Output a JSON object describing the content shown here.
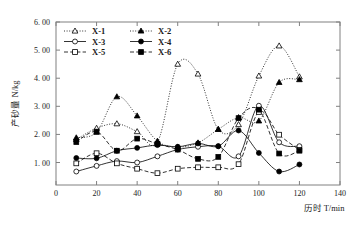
{
  "chart_data": {
    "type": "line",
    "title": "",
    "xlabel": "历时 T/min",
    "ylabel": "产砂量 N/kg",
    "xlim": [
      0,
      140
    ],
    "ylim": [
      0.2,
      6.0
    ],
    "xticks": [
      0,
      20,
      40,
      60,
      80,
      100,
      120,
      140
    ],
    "xtick_labels": [
      "0",
      "20",
      "40",
      "60",
      "80",
      "100",
      "120",
      "140"
    ],
    "yticks": [
      1.0,
      2.0,
      3.0,
      4.0,
      5.0,
      6.0
    ],
    "ytick_labels": [
      "1. 00",
      "2. 00",
      "3. 00",
      "4. 00",
      "5. 00",
      "6. 00"
    ],
    "grid": false,
    "legend_position": "top-left-inside",
    "x": [
      10,
      20,
      30,
      40,
      50,
      60,
      70,
      80,
      90,
      100,
      110,
      120
    ],
    "series": [
      {
        "name": "X-1",
        "label": "X-1",
        "marker": "open-triangle",
        "line_style": "dotted",
        "color": "#000000",
        "values": [
          1.82,
          2.22,
          2.38,
          2.1,
          1.72,
          4.5,
          4.15,
          2.18,
          2.35,
          4.08,
          5.15,
          4.05
        ]
      },
      {
        "name": "X-2",
        "label": "X-2",
        "marker": "filled-triangle",
        "line_style": "dotted",
        "color": "#000000",
        "values": [
          1.88,
          2.08,
          3.34,
          2.66,
          1.76,
          1.55,
          1.7,
          2.18,
          2.6,
          2.48,
          3.85,
          3.95
        ]
      },
      {
        "name": "X-3",
        "label": "X-3",
        "marker": "open-circle",
        "line_style": "solid",
        "color": "#000000",
        "values": [
          0.68,
          0.88,
          1.05,
          1.0,
          1.22,
          1.46,
          1.56,
          1.58,
          1.22,
          3.02,
          1.72,
          1.58
        ]
      },
      {
        "name": "X-4",
        "label": "X-4",
        "marker": "filled-circle",
        "line_style": "solid",
        "color": "#000000",
        "values": [
          1.16,
          1.15,
          1.42,
          1.52,
          1.62,
          1.56,
          1.68,
          1.58,
          2.14,
          1.34,
          0.68,
          0.93
        ]
      },
      {
        "name": "X-5",
        "label": "X-5",
        "marker": "open-square",
        "line_style": "dashed",
        "color": "#000000",
        "values": [
          0.97,
          1.33,
          0.97,
          0.78,
          0.62,
          0.78,
          0.83,
          0.83,
          0.94,
          2.8,
          1.99,
          1.45
        ]
      },
      {
        "name": "X-6",
        "label": "X-6",
        "marker": "filled-square",
        "line_style": "dashed",
        "color": "#000000",
        "values": [
          1.73,
          2.1,
          1.42,
          1.85,
          1.66,
          1.46,
          1.13,
          1.2,
          2.58,
          2.88,
          1.32,
          1.42
        ]
      }
    ]
  },
  "legend": {
    "entries": [
      {
        "label": "X-1",
        "marker": "open-triangle",
        "line_style": "dotted"
      },
      {
        "label": "X-2",
        "marker": "filled-triangle",
        "line_style": "dotted"
      },
      {
        "label": "X-3",
        "marker": "open-circle",
        "line_style": "solid"
      },
      {
        "label": "X-4",
        "marker": "filled-circle",
        "line_style": "solid"
      },
      {
        "label": "X-5",
        "marker": "open-square",
        "line_style": "dashed"
      },
      {
        "label": "X-6",
        "marker": "filled-square",
        "line_style": "dashed"
      }
    ]
  },
  "style": {
    "axis_color": "#808080",
    "line_color": "#000000",
    "background": "#ffffff"
  }
}
